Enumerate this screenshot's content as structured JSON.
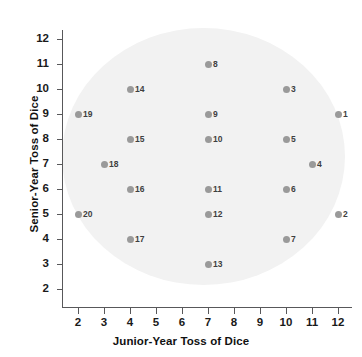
{
  "chart_data": {
    "type": "scatter",
    "title": "",
    "xlabel": "Junior-Year Toss of Dice",
    "ylabel": "Senior-Year Toss of Dice",
    "xlim": [
      2,
      12
    ],
    "ylim": [
      2,
      12
    ],
    "grid": false,
    "legend": "none",
    "xticks": [
      "2",
      "3",
      "4",
      "5",
      "6",
      "7",
      "8",
      "9",
      "10",
      "11",
      "12"
    ],
    "yticks": [
      "2",
      "3",
      "4",
      "5",
      "6",
      "7",
      "8",
      "9",
      "10",
      "11",
      "12"
    ],
    "marker_color": "#9a9a9a",
    "label_color": "#3f3f3f",
    "cloud_color": "#f2f2f2",
    "axis_color": "#58585a",
    "points": [
      {
        "label": "1",
        "x": 12,
        "y": 9
      },
      {
        "label": "2",
        "x": 12,
        "y": 5
      },
      {
        "label": "3",
        "x": 10,
        "y": 10
      },
      {
        "label": "4",
        "x": 11,
        "y": 7
      },
      {
        "label": "5",
        "x": 10,
        "y": 8
      },
      {
        "label": "6",
        "x": 10,
        "y": 6
      },
      {
        "label": "7",
        "x": 10,
        "y": 4
      },
      {
        "label": "8",
        "x": 7,
        "y": 11
      },
      {
        "label": "9",
        "x": 7,
        "y": 9
      },
      {
        "label": "10",
        "x": 7,
        "y": 8
      },
      {
        "label": "11",
        "x": 7,
        "y": 6
      },
      {
        "label": "12",
        "x": 7,
        "y": 5
      },
      {
        "label": "13",
        "x": 7,
        "y": 3
      },
      {
        "label": "14",
        "x": 4,
        "y": 10
      },
      {
        "label": "15",
        "x": 4,
        "y": 8
      },
      {
        "label": "16",
        "x": 4,
        "y": 6
      },
      {
        "label": "17",
        "x": 4,
        "y": 4
      },
      {
        "label": "18",
        "x": 3,
        "y": 7
      },
      {
        "label": "19",
        "x": 2,
        "y": 9
      },
      {
        "label": "20",
        "x": 2,
        "y": 5
      }
    ]
  }
}
